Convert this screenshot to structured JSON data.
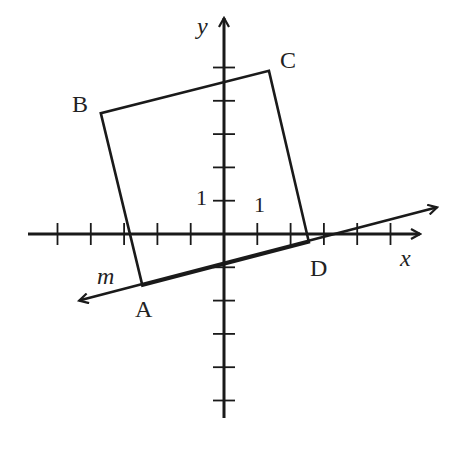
{
  "diagram": {
    "axes": {
      "x_label": "x",
      "y_label": "y",
      "x_range": [
        -6,
        6
      ],
      "y_range": [
        -5.5,
        5.7
      ],
      "x_ticks": [
        -5,
        -4,
        -3,
        -2,
        -1,
        1,
        2,
        3,
        4,
        5
      ],
      "y_ticks": [
        -5,
        -4,
        -3,
        -2,
        -1,
        1,
        2,
        3,
        4,
        5
      ],
      "unit_labels": {
        "x": "1",
        "y": "1"
      }
    },
    "quadrilateral": {
      "vertices": [
        {
          "name": "A",
          "x": -2.45,
          "y": -1.55
        },
        {
          "name": "B",
          "x": -3.7,
          "y": 3.63
        },
        {
          "name": "C",
          "x": 1.35,
          "y": 4.9
        },
        {
          "name": "D",
          "x": 2.55,
          "y": -0.25
        }
      ]
    },
    "line": {
      "name": "m",
      "from": {
        "x": -4.35,
        "y": -2.0
      },
      "to": {
        "x": 6.4,
        "y": 0.8
      }
    },
    "colors": {
      "stroke": "#1a1a1a",
      "text": "#222222"
    }
  }
}
